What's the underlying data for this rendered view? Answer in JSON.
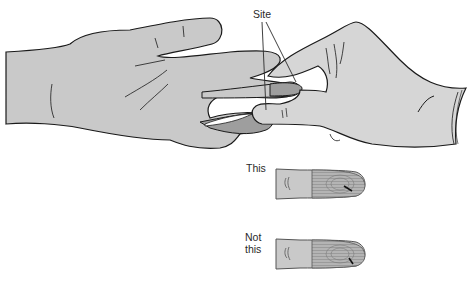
{
  "figure": {
    "type": "medical-illustration",
    "colors": {
      "skin": "#c9c9c9",
      "glove": "#d6d6d6",
      "fingertip_shade": "#9e9e9e",
      "outline": "#1a1a1a",
      "background": "#ffffff"
    }
  },
  "labels": {
    "site": "Site",
    "this": "This",
    "not_this_line1": "Not",
    "not_this_line2": "this"
  },
  "panels": [
    {
      "id": "main",
      "description": "Gloved hand holding patient's middle finger; lines point to puncture site on fingertip"
    },
    {
      "id": "correct",
      "caption": "This",
      "description": "Puncture perpendicular to fingerprint whorls"
    },
    {
      "id": "incorrect",
      "caption": "Not this",
      "description": "Puncture parallel to fingerprint whorls"
    }
  ]
}
